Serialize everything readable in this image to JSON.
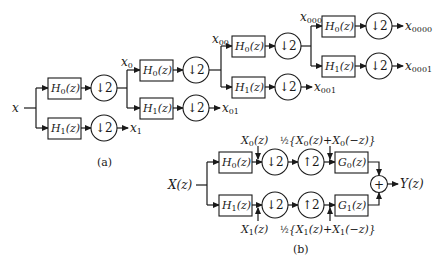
{
  "diagram": {
    "type": "filter-bank-block-diagram",
    "colors": {
      "stroke": "#1a1a1a",
      "background": "#ffffff"
    },
    "part_a": {
      "caption": "(a)",
      "input_label": "x",
      "blocks": {
        "h0": "H",
        "h1": "H",
        "h0_sub": "0",
        "h1_sub": "1",
        "arg": "(z)",
        "down": "↓2"
      },
      "signals": {
        "x0": {
          "base": "x",
          "sub": "0"
        },
        "x1": {
          "base": "x",
          "sub": "1"
        },
        "x00": {
          "base": "x",
          "sub": "00"
        },
        "x01": {
          "base": "x",
          "sub": "01"
        },
        "x000": {
          "base": "x",
          "sub": "000"
        },
        "x001": {
          "base": "x",
          "sub": "001"
        },
        "x0000": {
          "base": "x",
          "sub": "0000"
        },
        "x0001": {
          "base": "x",
          "sub": "0001"
        }
      }
    },
    "part_b": {
      "caption": "(b)",
      "input_label": "X(z)",
      "output_label": "Y(z)",
      "blocks": {
        "h0": "H",
        "h0_sub": "0",
        "h1": "H",
        "h1_sub": "1",
        "g0": "G",
        "g0_sub": "0",
        "g1": "G",
        "g1_sub": "1",
        "arg": "(z)",
        "down": "↓2",
        "up": "↑2",
        "sum": "+"
      },
      "annotations": {
        "top_left": {
          "base": "X",
          "sub": "0",
          "tail": "(z)"
        },
        "top_right": {
          "half": "½",
          "open": "{X",
          "sub1": "0",
          "mid": "(z)+X",
          "sub2": "0",
          "close": "(−z)}"
        },
        "bottom_left": {
          "base": "X",
          "sub": "1",
          "tail": "(z)"
        },
        "bottom_right": {
          "half": "½",
          "open": "{X",
          "sub1": "1",
          "mid": "(z)+X",
          "sub2": "1",
          "close": "(−z)}"
        }
      }
    }
  }
}
